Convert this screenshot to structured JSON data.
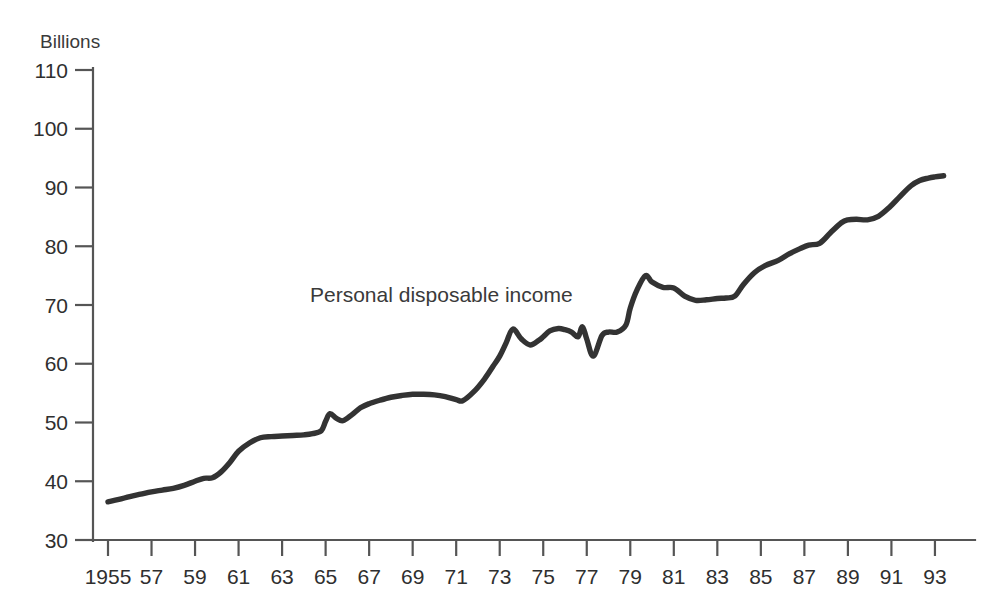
{
  "figure": {
    "unit_label": "Billions",
    "annotation": "Personal disposable income"
  },
  "chart_data": {
    "type": "line",
    "title": "",
    "subtitle": "",
    "xlabel": "",
    "ylabel": "Billions",
    "annotations": [
      "Personal disposable income"
    ],
    "legend": [],
    "legend_position": "inline-label",
    "grid": false,
    "line_color": "#333333",
    "xlim": [
      1955,
      1993.6
    ],
    "ylim": [
      30,
      110
    ],
    "xtick_labels": [
      "1955",
      "57",
      "59",
      "61",
      "63",
      "65",
      "67",
      "69",
      "71",
      "73",
      "75",
      "77",
      "79",
      "81",
      "83",
      "85",
      "87",
      "89",
      "91",
      "93"
    ],
    "xtick_values": [
      1955,
      1957,
      1959,
      1961,
      1963,
      1965,
      1967,
      1969,
      1971,
      1973,
      1975,
      1977,
      1979,
      1981,
      1983,
      1985,
      1987,
      1989,
      1991,
      1993
    ],
    "ytick_labels": [
      "30",
      "40",
      "50",
      "60",
      "70",
      "80",
      "90",
      "100",
      "110"
    ],
    "ytick_values": [
      30,
      40,
      50,
      60,
      70,
      80,
      90,
      100,
      110
    ],
    "series": [
      {
        "name": "Personal disposable income",
        "x": [
          1955.0,
          1955.5,
          1956.0,
          1956.5,
          1957.0,
          1957.5,
          1958.0,
          1958.5,
          1959.0,
          1959.4,
          1959.8,
          1960.2,
          1960.6,
          1961.0,
          1961.5,
          1962.0,
          1962.5,
          1963.0,
          1963.5,
          1964.0,
          1964.4,
          1964.8,
          1965.0,
          1965.2,
          1965.5,
          1965.8,
          1966.2,
          1966.6,
          1967.0,
          1967.5,
          1968.0,
          1968.5,
          1969.0,
          1969.5,
          1970.0,
          1970.5,
          1971.0,
          1971.3,
          1971.8,
          1972.3,
          1972.7,
          1973.0,
          1973.3,
          1973.6,
          1974.0,
          1974.4,
          1974.8,
          1975.0,
          1975.3,
          1975.7,
          1976.0,
          1976.3,
          1976.6,
          1976.8,
          1977.0,
          1977.3,
          1977.7,
          1978.0,
          1978.4,
          1978.8,
          1979.0,
          1979.3,
          1979.7,
          1980.0,
          1980.5,
          1981.0,
          1981.5,
          1982.0,
          1982.5,
          1983.0,
          1983.4,
          1983.8,
          1984.2,
          1984.7,
          1985.2,
          1985.8,
          1986.3,
          1986.8,
          1987.2,
          1987.7,
          1988.2,
          1988.7,
          1989.0,
          1989.4,
          1989.9,
          1990.4,
          1990.9,
          1991.4,
          1991.9,
          1992.3,
          1992.7,
          1993.0,
          1993.4
        ],
        "y": [
          36.5,
          36.9,
          37.4,
          37.8,
          38.2,
          38.5,
          38.8,
          39.3,
          40.0,
          40.5,
          40.6,
          41.6,
          43.2,
          45.1,
          46.5,
          47.4,
          47.6,
          47.7,
          47.8,
          47.9,
          48.1,
          48.6,
          50.2,
          51.5,
          50.7,
          50.3,
          51.3,
          52.5,
          53.2,
          53.8,
          54.3,
          54.6,
          54.8,
          54.8,
          54.7,
          54.4,
          53.9,
          53.7,
          55.2,
          57.4,
          59.6,
          61.3,
          63.6,
          65.9,
          64.2,
          63.2,
          64.0,
          64.6,
          65.6,
          66.0,
          65.8,
          65.4,
          64.6,
          66.3,
          64.2,
          61.3,
          64.8,
          65.4,
          65.4,
          66.6,
          69.5,
          72.5,
          75.0,
          73.9,
          73.0,
          72.9,
          71.5,
          70.8,
          70.9,
          71.1,
          71.2,
          71.5,
          73.5,
          75.5,
          76.7,
          77.6,
          78.7,
          79.6,
          80.2,
          80.5,
          82.3,
          84.0,
          84.5,
          84.6,
          84.5,
          85.1,
          86.6,
          88.5,
          90.3,
          91.2,
          91.6,
          91.8,
          92.0
        ]
      }
    ]
  },
  "axes": {
    "y_axis_name": "y-axis",
    "x_axis_name": "x-axis"
  }
}
